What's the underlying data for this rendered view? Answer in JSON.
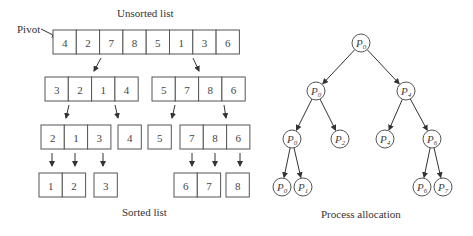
{
  "labels": {
    "unsorted": "Unsorted list",
    "sorted": "Sorted list",
    "pivot": "Pivot",
    "process_allocation": "Process allocation"
  },
  "quicksort": {
    "cell_width": 23.3,
    "cell_height": 24,
    "rows": [
      {
        "name": "row-unsorted",
        "y": 30,
        "groups": [
          {
            "x": 53,
            "values": [
              "4",
              "2",
              "7",
              "8",
              "5",
              "1",
              "3",
              "6"
            ]
          }
        ]
      },
      {
        "name": "row-level-1",
        "y": 77,
        "groups": [
          {
            "x": 45,
            "values": [
              "3",
              "2",
              "1",
              "4"
            ]
          },
          {
            "x": 152,
            "values": [
              "5",
              "7",
              "8",
              "6"
            ]
          }
        ]
      },
      {
        "name": "row-level-2",
        "y": 125,
        "groups": [
          {
            "x": 41,
            "values": [
              "2",
              "1",
              "3"
            ]
          },
          {
            "x": 118,
            "values": [
              "4"
            ]
          },
          {
            "x": 148,
            "values": [
              "5"
            ]
          },
          {
            "x": 180,
            "values": [
              "7",
              "8",
              "6"
            ]
          }
        ]
      },
      {
        "name": "row-sorted",
        "y": 173,
        "groups": [
          {
            "x": 39,
            "values": [
              "1",
              "2"
            ]
          },
          {
            "x": 94,
            "values": [
              "3"
            ]
          },
          {
            "x": 174,
            "values": [
              "6",
              "7"
            ]
          },
          {
            "x": 226,
            "values": [
              "8"
            ]
          }
        ]
      }
    ],
    "arrows": [
      [
        101,
        58,
        94,
        71
      ],
      [
        193,
        58,
        199,
        71
      ],
      [
        69,
        105,
        66,
        118
      ],
      [
        115,
        105,
        118,
        118
      ],
      [
        175,
        105,
        172,
        118
      ],
      [
        224,
        105,
        226,
        118
      ],
      [
        52,
        153,
        52,
        166
      ],
      [
        75,
        153,
        75,
        166
      ],
      [
        103,
        153,
        103,
        166
      ],
      [
        192,
        153,
        192,
        166
      ],
      [
        215,
        153,
        215,
        166
      ],
      [
        240,
        153,
        240,
        166
      ]
    ]
  },
  "tree": {
    "radius": 9,
    "nodes": [
      {
        "id": "root",
        "label": "P",
        "sub": "0",
        "x": 361,
        "y": 43
      },
      {
        "id": "l2a",
        "label": "P",
        "sub": "0",
        "x": 316,
        "y": 91
      },
      {
        "id": "l2b",
        "label": "P",
        "sub": "4",
        "x": 406,
        "y": 91
      },
      {
        "id": "l3a",
        "label": "P",
        "sub": "0",
        "x": 292,
        "y": 139
      },
      {
        "id": "l3b",
        "label": "P",
        "sub": "2",
        "x": 340,
        "y": 139
      },
      {
        "id": "l3c",
        "label": "P",
        "sub": "4",
        "x": 385,
        "y": 139
      },
      {
        "id": "l3d",
        "label": "P",
        "sub": "6",
        "x": 432,
        "y": 139
      },
      {
        "id": "l4a",
        "label": "P",
        "sub": "0",
        "x": 282,
        "y": 187
      },
      {
        "id": "l4b",
        "label": "P",
        "sub": "1",
        "x": 303,
        "y": 187
      },
      {
        "id": "l4c",
        "label": "P",
        "sub": "6",
        "x": 422,
        "y": 187
      },
      {
        "id": "l4d",
        "label": "P",
        "sub": "7",
        "x": 443,
        "y": 187
      }
    ],
    "edges": [
      [
        "root",
        "l2a"
      ],
      [
        "root",
        "l2b"
      ],
      [
        "l2a",
        "l3a"
      ],
      [
        "l2a",
        "l3b"
      ],
      [
        "l2b",
        "l3c"
      ],
      [
        "l2b",
        "l3d"
      ],
      [
        "l3a",
        "l4a"
      ],
      [
        "l3a",
        "l4b"
      ],
      [
        "l3d",
        "l4c"
      ],
      [
        "l3d",
        "l4d"
      ]
    ]
  }
}
